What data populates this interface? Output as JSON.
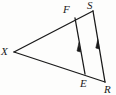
{
  "figure": {
    "kind": "geometry-diagram",
    "background_color": "#fdfdfc",
    "stroke_color": "#1a1a1a",
    "label_color": "#1a1a1a",
    "width": 116,
    "height": 95
  },
  "points": {
    "X": {
      "label": "X",
      "x": 14,
      "y": 52
    },
    "F": {
      "label": "F",
      "x": 75,
      "y": 18
    },
    "S": {
      "label": "S",
      "x": 93,
      "y": 11
    },
    "E": {
      "label": "E",
      "x": 85,
      "y": 74
    },
    "R": {
      "label": "R",
      "x": 105,
      "y": 82
    }
  },
  "segments": [
    {
      "name": "XS",
      "from": "X",
      "to": "S",
      "through": "F"
    },
    {
      "name": "XR",
      "from": "X",
      "to": "R",
      "through": "E"
    },
    {
      "name": "FE",
      "from": "F",
      "to": "E",
      "tick": "single-arrow"
    },
    {
      "name": "SR",
      "from": "S",
      "to": "R",
      "tick": "single-arrow"
    }
  ],
  "parallel_marks": [
    {
      "on": "FE",
      "glyph": "single-arrow",
      "direction": "toward-F",
      "x": 80,
      "y": 48
    },
    {
      "on": "SR",
      "glyph": "single-arrow",
      "direction": "toward-S",
      "x": 98,
      "y": 45
    }
  ]
}
